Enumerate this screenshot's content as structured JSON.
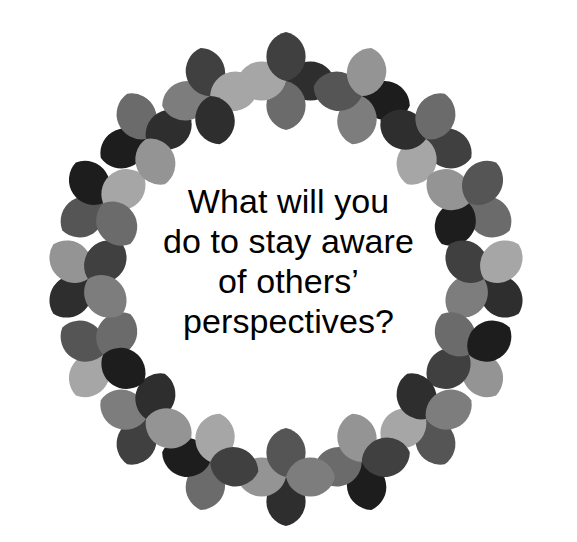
{
  "canvas": {
    "width": 577,
    "height": 542,
    "background_color": "#ffffff"
  },
  "quote": {
    "alt_text": "What will you do to stay aware of others' perspectives?",
    "text_color": "#000000",
    "lines": [
      "What will you",
      "do to stay aware",
      "of others’",
      "perspectives?"
    ]
  },
  "decoration": {
    "name": "quatrefoil-rosette-ring",
    "description": "Ring of four-petal rosettes formed from pointed-oval (vesica) petals in grayscale shades",
    "ring": {
      "center_x": 286,
      "center_y": 279,
      "radius": 198,
      "rosette_count": 16,
      "rosette_radius": 49,
      "start_angle_deg": -90
    },
    "palette": {
      "near_black": "#1d1d1d",
      "dark": "#2e2e2e",
      "dark_gray": "#404040",
      "mid_dark_gray": "#555555",
      "mid_gray": "#6b6b6b",
      "gray": "#7d7d7d",
      "light_gray": "#949494",
      "lighter_gray": "#a6a6a6"
    },
    "rosettes": [
      {
        "index": 0,
        "angle_deg": -90,
        "petal_colors": [
          "#2e2e2e",
          "#6b6b6b",
          "#a6a6a6",
          "#404040"
        ]
      },
      {
        "index": 1,
        "angle_deg": -67.5,
        "petal_colors": [
          "#1d1d1d",
          "#7d7d7d",
          "#555555",
          "#949494"
        ]
      },
      {
        "index": 2,
        "angle_deg": -45,
        "petal_colors": [
          "#404040",
          "#a6a6a6",
          "#2e2e2e",
          "#6b6b6b"
        ]
      },
      {
        "index": 3,
        "angle_deg": -22.5,
        "petal_colors": [
          "#6b6b6b",
          "#1d1d1d",
          "#949494",
          "#555555"
        ]
      },
      {
        "index": 4,
        "angle_deg": 0,
        "petal_colors": [
          "#2e2e2e",
          "#7d7d7d",
          "#404040",
          "#a6a6a6"
        ]
      },
      {
        "index": 5,
        "angle_deg": 22.5,
        "petal_colors": [
          "#949494",
          "#404040",
          "#6b6b6b",
          "#1d1d1d"
        ]
      },
      {
        "index": 6,
        "angle_deg": 45,
        "petal_colors": [
          "#555555",
          "#a6a6a6",
          "#2e2e2e",
          "#7d7d7d"
        ]
      },
      {
        "index": 7,
        "angle_deg": 67.5,
        "petal_colors": [
          "#1d1d1d",
          "#6b6b6b",
          "#949494",
          "#404040"
        ]
      },
      {
        "index": 8,
        "angle_deg": 90,
        "petal_colors": [
          "#2e2e2e",
          "#949494",
          "#555555",
          "#7d7d7d"
        ]
      },
      {
        "index": 9,
        "angle_deg": 112.5,
        "petal_colors": [
          "#6b6b6b",
          "#1d1d1d",
          "#a6a6a6",
          "#404040"
        ]
      },
      {
        "index": 10,
        "angle_deg": 135,
        "petal_colors": [
          "#404040",
          "#7d7d7d",
          "#2e2e2e",
          "#949494"
        ]
      },
      {
        "index": 11,
        "angle_deg": 157.5,
        "petal_colors": [
          "#a6a6a6",
          "#555555",
          "#6b6b6b",
          "#1d1d1d"
        ]
      },
      {
        "index": 12,
        "angle_deg": 180,
        "petal_colors": [
          "#2e2e2e",
          "#949494",
          "#404040",
          "#7d7d7d"
        ]
      },
      {
        "index": 13,
        "angle_deg": 202.5,
        "petal_colors": [
          "#555555",
          "#1d1d1d",
          "#a6a6a6",
          "#6b6b6b"
        ]
      },
      {
        "index": 14,
        "angle_deg": 225,
        "petal_colors": [
          "#1d1d1d",
          "#6b6b6b",
          "#2e2e2e",
          "#949494"
        ]
      },
      {
        "index": 15,
        "angle_deg": 247.5,
        "petal_colors": [
          "#7d7d7d",
          "#404040",
          "#a6a6a6",
          "#2e2e2e"
        ]
      }
    ]
  }
}
